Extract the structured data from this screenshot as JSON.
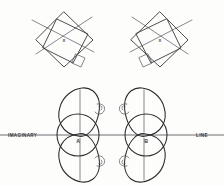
{
  "figure": {
    "background_color": "#fdfdfc",
    "ink_color": "#3a3a3c",
    "axis_color": "#6e6e72",
    "width": 224,
    "height": 186,
    "top_row": {
      "name": "overlapping-rotated-squares-pair",
      "left": {
        "label": "X",
        "orientation": "appendage-bottom-right"
      },
      "right": {
        "label": "X",
        "orientation": "appendage-bottom-left"
      }
    },
    "bottom_row": {
      "name": "mirrored-body-pair",
      "left": {
        "label": "A",
        "orientation": "appendages-right"
      },
      "right": {
        "label": "B",
        "orientation": "appendages-left"
      }
    },
    "axis": {
      "left_label": "IMAGINARY",
      "right_label": "LINE",
      "y": 135
    }
  }
}
